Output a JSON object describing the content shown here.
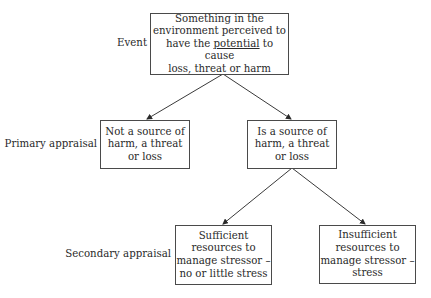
{
  "diagram": {
    "type": "flowchart-tree",
    "levels": [
      {
        "label": "Event"
      },
      {
        "label": "Primary appraisal"
      },
      {
        "label": "Secondary appraisal"
      }
    ],
    "nodes": {
      "event": {
        "line1": "Something in the",
        "line2": "environment perceived to",
        "line3_pre": "have the ",
        "line3_emph": "potential",
        "line3_post": " to cause",
        "line4": "loss, threat or harm"
      },
      "not_source": {
        "text": "Not a source of\nharm, a threat\nor loss"
      },
      "is_source": {
        "text": "Is a source of\nharm, a threat\nor loss"
      },
      "sufficient": {
        "text": "Sufficient\nresources to\nmanage stressor –\nno or little stress"
      },
      "insufficient": {
        "text": "Insufficient\nresources to\nmanage stressor –\nstress"
      }
    },
    "edges": [
      {
        "from": "event",
        "to": "not_source"
      },
      {
        "from": "event",
        "to": "is_source"
      },
      {
        "from": "is_source",
        "to": "sufficient"
      },
      {
        "from": "is_source",
        "to": "insufficient"
      }
    ],
    "line_color": "#3a3a3a"
  }
}
